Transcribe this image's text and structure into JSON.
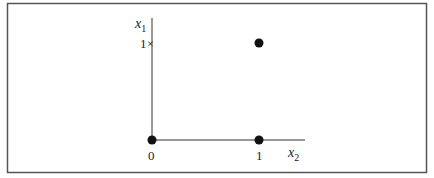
{
  "diagram": {
    "title": "",
    "axes": {
      "x": {
        "label_base": "x",
        "label_sub": "2",
        "ticks": [
          {
            "value": 0,
            "label": "0"
          },
          {
            "value": 1,
            "label": "1"
          }
        ]
      },
      "y": {
        "label_base": "x",
        "label_sub": "1",
        "ticks": [
          {
            "value": 1,
            "label": "1",
            "marker": "×"
          }
        ]
      }
    },
    "points": [
      {
        "x": 0,
        "y": 0,
        "marker": "filled-circle"
      },
      {
        "x": 1,
        "y": 0,
        "marker": "filled-circle"
      },
      {
        "x": 1,
        "y": 1,
        "marker": "filled-circle"
      }
    ],
    "colors": {
      "ink": "#111111",
      "frame": "#555555",
      "background": "#ffffff"
    }
  }
}
